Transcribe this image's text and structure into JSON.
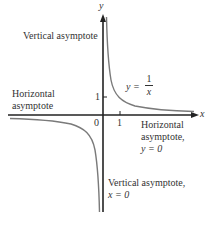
{
  "figure": {
    "function_label": {
      "lhs": "y =",
      "numerator": "1",
      "denominator": "x"
    },
    "axes": {
      "x_label": "x",
      "y_label": "y",
      "origin_label": "0",
      "x_tick_label": "1",
      "y_tick_label": "1"
    },
    "annotations": {
      "vertical_top": "Vertical asymptote",
      "horizontal_left_line1": "Horizontal",
      "horizontal_left_line2": "asymptote",
      "horizontal_right_line1": "Horizontal",
      "horizontal_right_line2": "asymptote,",
      "horizontal_right_line3": "y = 0",
      "vertical_bottom_line1": "Vertical asymptote,",
      "vertical_bottom_line2": "x = 0"
    },
    "colors": {
      "axis": "#222222",
      "curve": "#7a7a7a",
      "text": "#333333"
    }
  }
}
